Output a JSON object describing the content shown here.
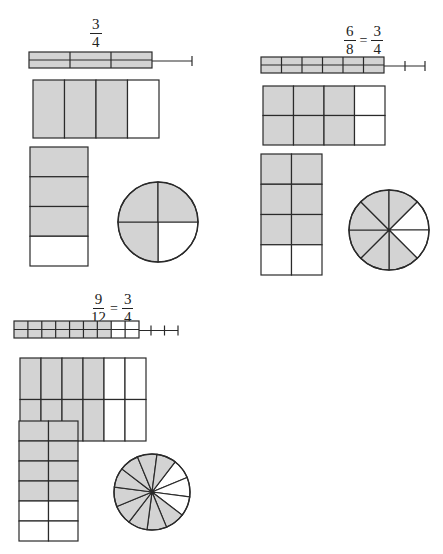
{
  "colors": {
    "shaded": "#d3d3d3",
    "unshaded": "#ffffff",
    "stroke": "#2a2a2a"
  },
  "panels": [
    {
      "id": "three-quarters",
      "label": {
        "fractions": [
          {
            "num": "3",
            "den": "4"
          }
        ],
        "equals": []
      },
      "strip_model": {
        "cols": 3,
        "rows": 2,
        "shaded_cols": 3,
        "extension_ticks": 1
      },
      "area_model": {
        "cols": 4,
        "rows": 1,
        "shaded_cols": 3
      },
      "tall_model": {
        "cols": 1,
        "rows": 4,
        "shaded_rows": 3
      },
      "pie_model": {
        "slices": 4,
        "shaded": 3
      }
    },
    {
      "id": "six-eighths",
      "label": {
        "fractions": [
          {
            "num": "6",
            "den": "8"
          },
          {
            "num": "3",
            "den": "4"
          }
        ],
        "equals": [
          "="
        ]
      },
      "strip_model": {
        "cols": 6,
        "rows": 2,
        "shaded_cols": 6,
        "extension_ticks": 2
      },
      "area_model": {
        "cols": 4,
        "rows": 2,
        "shaded_cols": 3
      },
      "tall_model": {
        "cols": 2,
        "rows": 4,
        "shaded_rows": 3
      },
      "pie_model": {
        "slices": 8,
        "shaded": 6
      }
    },
    {
      "id": "nine-twelfths",
      "label": {
        "fractions": [
          {
            "num": "9",
            "den": "12"
          },
          {
            "num": "3",
            "den": "4"
          }
        ],
        "equals": [
          "="
        ]
      },
      "strip_model": {
        "cols": 9,
        "rows": 2,
        "shaded_cols": 7,
        "extension_ticks": 3
      },
      "area_model": {
        "cols": 6,
        "rows": 2,
        "shaded_cols": 4
      },
      "tall_model": {
        "cols": 2,
        "rows": 6,
        "shaded_rows": 4
      },
      "pie_model": {
        "slices": 12,
        "shaded": 9
      }
    }
  ]
}
